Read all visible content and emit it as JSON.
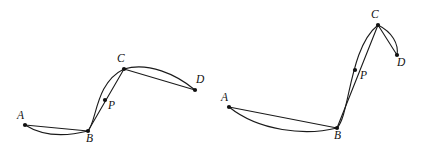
{
  "figure": {
    "background_color": "#ffffff",
    "stroke_color": "#1a1a1a",
    "dot_color": "#111111",
    "label_style": "italic-serif"
  },
  "panels": [
    {
      "id": "left",
      "name": "left-diagram",
      "points": [
        {
          "label": "A",
          "x": 25,
          "y": 125,
          "label_x": 17,
          "label_y": 110
        },
        {
          "label": "B",
          "x": 88,
          "y": 131,
          "label_x": 86,
          "label_y": 133
        },
        {
          "label": "P",
          "x": 105,
          "y": 100,
          "label_x": 108,
          "label_y": 100
        },
        {
          "label": "C",
          "x": 124,
          "y": 69,
          "label_x": 117,
          "label_y": 53
        },
        {
          "label": "D",
          "x": 195,
          "y": 90,
          "label_x": 196,
          "label_y": 74
        }
      ],
      "chords": [
        {
          "name": "chord-AB",
          "from": "A",
          "to": "B"
        },
        {
          "name": "chord-BC",
          "from": "B",
          "to": "C"
        },
        {
          "name": "chord-CD",
          "from": "C",
          "to": "D"
        }
      ],
      "curves": [
        {
          "name": "curve-AB",
          "path": "M 25 125 C 44 137, 68 136, 88 131"
        },
        {
          "name": "curve-BC",
          "path": "M 88 131 C 97 121, 95 83, 124 69"
        },
        {
          "name": "curve-CD",
          "path": "M 124 69 C 148 62, 176 74, 195 90"
        }
      ]
    },
    {
      "id": "right",
      "name": "right-diagram",
      "points": [
        {
          "label": "A",
          "x": 229,
          "y": 107,
          "label_x": 221,
          "label_y": 92
        },
        {
          "label": "B",
          "x": 337,
          "y": 128,
          "label_x": 334,
          "label_y": 130
        },
        {
          "label": "P",
          "x": 355,
          "y": 70,
          "label_x": 360,
          "label_y": 70
        },
        {
          "label": "C",
          "x": 378,
          "y": 25,
          "label_x": 371,
          "label_y": 9
        },
        {
          "label": "D",
          "x": 397,
          "y": 55,
          "label_x": 397,
          "label_y": 57
        }
      ],
      "chords": [
        {
          "name": "chord-AB",
          "from": "A",
          "to": "B"
        },
        {
          "name": "chord-BC",
          "from": "B",
          "to": "C"
        },
        {
          "name": "chord-CD",
          "from": "C",
          "to": "D"
        }
      ],
      "curves": [
        {
          "name": "curve-AB",
          "path": "M 229 107 C 259 131, 305 136, 337 128"
        },
        {
          "name": "curve-BC",
          "path": "M 337 128 C 350 115, 349 48, 378 25"
        },
        {
          "name": "curve-CD",
          "path": "M 378 25 C 392 32, 399 44, 397 55"
        }
      ]
    }
  ]
}
